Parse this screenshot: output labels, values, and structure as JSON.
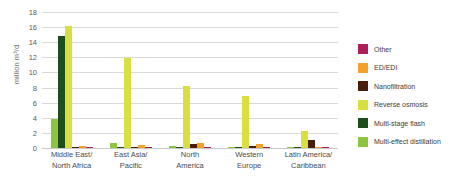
{
  "chart_data": {
    "type": "bar",
    "title": "",
    "xlabel": "",
    "ylabel": "million m³/d",
    "ylim": [
      0,
      18
    ],
    "ytick_step": 2,
    "yticks": [
      18,
      16,
      14,
      12,
      10,
      8,
      6,
      4,
      2,
      0
    ],
    "grid": true,
    "legend_position": "right",
    "categories": [
      "Middle East/\nNorth Africa",
      "East Asia/\nPacific",
      "North\nAmerica",
      "Western\nEurope",
      "Latin America/\nCaribbean"
    ],
    "category_lines": [
      [
        "Middle East/",
        "North Africa"
      ],
      [
        "East Asia/",
        "Pacific"
      ],
      [
        "North",
        "America"
      ],
      [
        "Western",
        "Europe"
      ],
      [
        "Latin America/",
        "Caribbean"
      ]
    ],
    "series": [
      {
        "name": "Multi-effect distillation",
        "color": "#8cc63e",
        "values": [
          3.8,
          0.6,
          0.25,
          0.2,
          0.2
        ]
      },
      {
        "name": "Multi-stage flash",
        "color": "#1e4d1e",
        "values": [
          14.8,
          0.15,
          0.05,
          0.05,
          0.05
        ]
      },
      {
        "name": "Reverse osmosis",
        "color": "#d7e040",
        "values": [
          16.1,
          11.9,
          8.2,
          6.9,
          2.3
        ]
      },
      {
        "name": "Nanofiltration",
        "color": "#4a1c0a",
        "values": [
          0.2,
          0.1,
          0.5,
          0.25,
          1.0
        ]
      },
      {
        "name": "ED/EDI",
        "color": "#f5a02a",
        "values": [
          0.3,
          0.35,
          0.7,
          0.5,
          0.2
        ]
      },
      {
        "name": "Other",
        "color": "#b01e5a",
        "values": [
          0.15,
          0.1,
          0.08,
          0.08,
          0.05
        ]
      }
    ]
  },
  "legend": {
    "items": [
      {
        "label": "Other",
        "color": "#b01e5a"
      },
      {
        "label": "ED/EDI",
        "color": "#f5a02a"
      },
      {
        "label": "Nanofiltration",
        "color": "#4a1c0a"
      },
      {
        "label": "Reverse osmosis",
        "color": "#d7e040"
      },
      {
        "label": "Multi-stage flash",
        "color": "#1e4d1e"
      },
      {
        "label": "Multi-effect distillation",
        "color": "#8cc63e"
      }
    ]
  }
}
